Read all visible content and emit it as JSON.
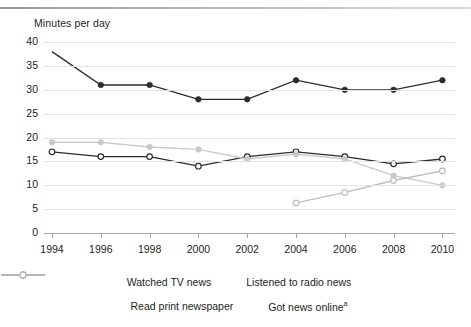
{
  "axis_title": "Minutes per day",
  "legend": {
    "rows": [
      [
        {
          "label": "Watched TV news",
          "key": "tv"
        },
        {
          "label": "Listened to radio news",
          "key": "radio"
        }
      ],
      [
        {
          "label": "Read print newspaper",
          "key": "newspaper"
        },
        {
          "label": "Got news online",
          "key": "online",
          "footnote": "a"
        }
      ]
    ]
  },
  "colors": {
    "tv": "#2b2b2b",
    "radio": "#2b2b2b",
    "newspaper": "#c9c9c9",
    "online": "#bdbdbd",
    "grid": "#e3e3e3",
    "axis": "#a8a8a8",
    "text": "#231f20"
  },
  "chart_data": {
    "type": "line",
    "title": "",
    "xlabel": "",
    "ylabel": "Minutes per day",
    "x": [
      1994,
      1996,
      1998,
      2000,
      2002,
      2004,
      2006,
      2008,
      2010
    ],
    "xticklabels": [
      "1994",
      "1996",
      "1998",
      "2000",
      "2002",
      "2004",
      "2006",
      "2008",
      "2010"
    ],
    "yticks": [
      0,
      5,
      10,
      15,
      20,
      25,
      30,
      35,
      40
    ],
    "yticklabels": [
      "0",
      "5",
      "10",
      "15",
      "20",
      "25",
      "30",
      "35",
      "40"
    ],
    "ylim": [
      0,
      40
    ],
    "xlim": [
      1994,
      2010
    ],
    "grid": true,
    "legend_position": "bottom",
    "series": [
      {
        "name": "Watched TV news",
        "key": "tv",
        "color": "#2b2b2b",
        "marker": "filled-circle",
        "values": [
          38,
          31,
          31,
          28,
          28,
          32,
          30,
          30,
          32
        ]
      },
      {
        "name": "Listened to radio news",
        "key": "radio",
        "color": "#2b2b2b",
        "marker": "open-circle",
        "values": [
          17,
          16,
          16,
          14,
          16,
          17,
          16,
          14.5,
          15.5
        ]
      },
      {
        "name": "Read print newspaper",
        "key": "newspaper",
        "color": "#c9c9c9",
        "marker": "filled-circle",
        "values": [
          19,
          19,
          18,
          17.5,
          15.5,
          16.5,
          15.5,
          12,
          10
        ]
      },
      {
        "name": "Got news online",
        "key": "online",
        "color": "#bdbdbd",
        "marker": "open-circle",
        "footnote": "a",
        "values": [
          null,
          null,
          null,
          null,
          null,
          6.3,
          8.5,
          11,
          13
        ]
      }
    ]
  }
}
